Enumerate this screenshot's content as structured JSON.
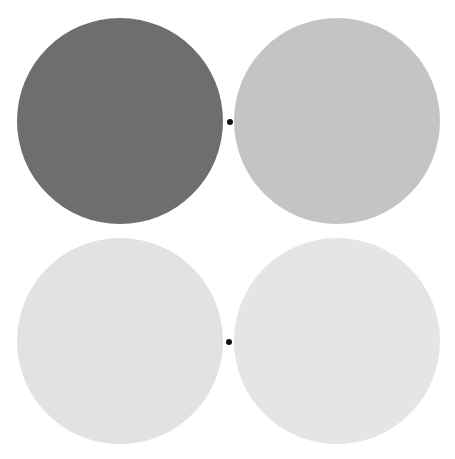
{
  "canvas": {
    "width": 455,
    "height": 459,
    "background": "#ffffff"
  },
  "discs": [
    {
      "id": "top-left",
      "cx": 120,
      "cy": 121,
      "r": 103,
      "color": "#6e6e6e"
    },
    {
      "id": "top-right",
      "cx": 337,
      "cy": 121,
      "r": 103,
      "color": "#c4c4c4"
    },
    {
      "id": "bottom-left",
      "cx": 120,
      "cy": 341,
      "r": 103,
      "color": "#e2e2e2"
    },
    {
      "id": "bottom-right",
      "cx": 337,
      "cy": 341,
      "r": 103,
      "color": "#e5e5e5"
    }
  ],
  "fixation_points": [
    {
      "id": "top-fixation",
      "cx": 230,
      "cy": 122,
      "r": 3,
      "color": "#111111"
    },
    {
      "id": "bottom-fixation",
      "cx": 229,
      "cy": 342,
      "r": 3,
      "color": "#111111"
    }
  ]
}
